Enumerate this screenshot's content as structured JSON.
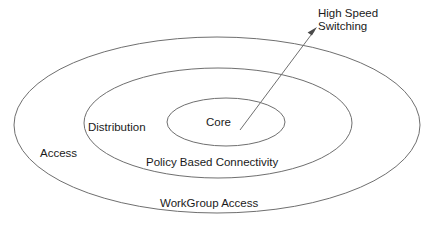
{
  "diagram": {
    "type": "concentric-ellipse-hierarchy",
    "background_color": "#ffffff",
    "stroke_color": "#6f6f6f",
    "text_color": "#1a1a1a",
    "rings": [
      {
        "id": "outer",
        "label": "Access",
        "sublabel": "WorkGroup Access",
        "cx": 217,
        "cy": 125,
        "rx": 203,
        "ry": 88
      },
      {
        "id": "middle",
        "label": "Distribution",
        "sublabel": "Policy Based Connectivity",
        "cx": 218,
        "cy": 123,
        "rx": 134,
        "ry": 55
      },
      {
        "id": "inner",
        "label": "Core",
        "sublabel": "High Speed Switching",
        "cx": 226,
        "cy": 122,
        "rx": 59,
        "ry": 24
      }
    ],
    "labels": {
      "access": "Access",
      "distribution": "Distribution",
      "core": "Core",
      "policy_based_connectivity": "Policy Based Connectivity",
      "workgroup_access": "WorkGroup Access"
    },
    "callout": {
      "line1": "High Speed",
      "line2": "Switching",
      "start_x": 240,
      "start_y": 130,
      "end_x": 317,
      "end_y": 28
    }
  }
}
